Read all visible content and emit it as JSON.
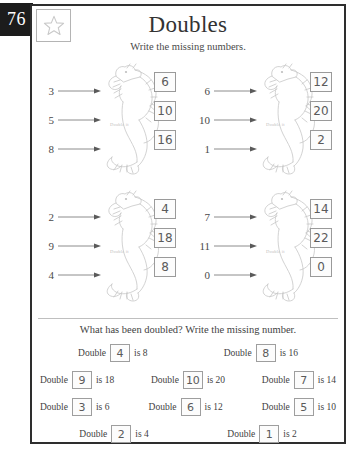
{
  "page_number": "76",
  "star_icon": "star-outline-icon",
  "title": "Doubles",
  "instruction": "Write the missing numbers.",
  "dragon_label": "Double it",
  "quadrants": [
    {
      "name": "top-left",
      "inputs": [
        "3",
        "5",
        "8"
      ],
      "answers": [
        "6",
        "10",
        "16"
      ]
    },
    {
      "name": "top-right",
      "inputs": [
        "6",
        "10",
        "1"
      ],
      "answers": [
        "12",
        "20",
        "2"
      ]
    },
    {
      "name": "bottom-left",
      "inputs": [
        "2",
        "9",
        "4"
      ],
      "answers": [
        "4",
        "18",
        "8"
      ]
    },
    {
      "name": "bottom-right",
      "inputs": [
        "7",
        "11",
        "0"
      ],
      "answers": [
        "14",
        "22",
        "0"
      ]
    }
  ],
  "bottom": {
    "heading": "What has been doubled? Write the missing number.",
    "double_word": "Double",
    "rows": [
      [
        {
          "answer": "4",
          "suffix": "is 8"
        },
        {
          "answer": "8",
          "suffix": "is 16"
        }
      ],
      [
        {
          "answer": "9",
          "suffix": "is 18"
        },
        {
          "answer": "10",
          "suffix": "is 20"
        },
        {
          "answer": "7",
          "suffix": "is 14"
        }
      ],
      [
        {
          "answer": "3",
          "suffix": "is 6"
        },
        {
          "answer": "6",
          "suffix": "is 12"
        },
        {
          "answer": "5",
          "suffix": "is 10"
        }
      ],
      [
        {
          "answer": "2",
          "suffix": "is 4"
        },
        {
          "answer": "1",
          "suffix": "is 2"
        }
      ]
    ]
  },
  "colors": {
    "badge_bg": "#1c1c1c",
    "frame_border": "#2e2e2e",
    "box_border": "#9a9a9a",
    "text": "#3a3a3a"
  }
}
